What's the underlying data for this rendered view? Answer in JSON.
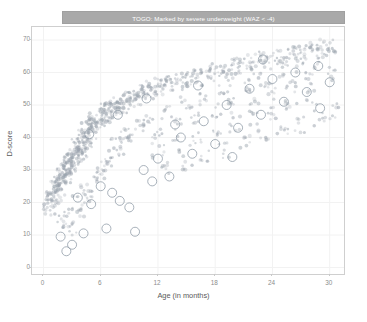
{
  "facet": {
    "strip_label": "TOGO: Marked by severe underweight (WAZ < -4)",
    "strip_bg": "#a9a9a9",
    "strip_text_color": "#ffffff"
  },
  "axis": {
    "x_title": "Age (in months)",
    "y_title": "D-score",
    "x_ticks": [
      "0",
      "6",
      "12",
      "18",
      "24",
      "30"
    ],
    "y_ticks": [
      "0",
      "10",
      "20",
      "30",
      "40",
      "50",
      "60",
      "70"
    ]
  },
  "colors": {
    "point": "#9aa3ad",
    "marked_point": "#8e9aa6",
    "panel_border": "#cfcfcf",
    "grid": "#f2f2f2",
    "tick_text": "#8c8c8c",
    "axis_title": "#5a5a5a",
    "background": "#ffffff"
  },
  "chart_data": {
    "type": "scatter",
    "title": "TOGO: Marked by severe underweight (WAZ < -4)",
    "xlabel": "Age (in months)",
    "ylabel": "D-score",
    "xlim": [
      -1.2,
      31.5
    ],
    "ylim": [
      -2.0,
      74.0
    ],
    "x_ticks": [
      0,
      6,
      12,
      18,
      24,
      30
    ],
    "y_ticks": [
      0,
      10,
      20,
      30,
      40,
      50,
      60,
      70
    ],
    "grid": true,
    "legend": null,
    "series": [
      {
        "name": "All children",
        "role": "background-points",
        "marker": "filled-circle",
        "size": 1.6,
        "color": "#9aa3ad",
        "opacity": 0.55,
        "description": "Dense cloud of D-score vs age observations forming a saturating growth band rising steeply from ~20 at 2 months to ~68 at 30 months, with wide downward scatter.",
        "points": [
          [
            0.6,
            19.5
          ],
          [
            0.7,
            21.0
          ],
          [
            0.8,
            18.0
          ],
          [
            0.9,
            22.5
          ],
          [
            1.0,
            20.0
          ],
          [
            1.1,
            24.0
          ],
          [
            1.2,
            23.0
          ],
          [
            1.3,
            25.5
          ],
          [
            1.4,
            22.0
          ],
          [
            1.5,
            26.0
          ],
          [
            1.6,
            27.0
          ],
          [
            1.7,
            24.5
          ],
          [
            1.8,
            28.0
          ],
          [
            1.9,
            26.5
          ],
          [
            2.0,
            29.0
          ],
          [
            2.1,
            27.5
          ],
          [
            2.2,
            30.0
          ],
          [
            2.3,
            28.5
          ],
          [
            2.4,
            31.0
          ],
          [
            2.5,
            29.5
          ],
          [
            2.6,
            32.0
          ],
          [
            2.7,
            30.5
          ],
          [
            2.8,
            33.0
          ],
          [
            2.9,
            31.5
          ],
          [
            3.0,
            34.0
          ],
          [
            3.1,
            32.5
          ],
          [
            3.2,
            35.0
          ],
          [
            3.3,
            33.5
          ],
          [
            3.4,
            36.0
          ],
          [
            3.5,
            34.5
          ],
          [
            3.6,
            37.0
          ],
          [
            3.7,
            35.5
          ],
          [
            3.8,
            38.0
          ],
          [
            3.9,
            36.5
          ],
          [
            4.0,
            39.0
          ],
          [
            4.1,
            37.5
          ],
          [
            4.2,
            40.0
          ],
          [
            4.3,
            38.5
          ],
          [
            4.4,
            41.0
          ],
          [
            4.5,
            39.5
          ],
          [
            4.6,
            42.0
          ],
          [
            4.7,
            40.5
          ],
          [
            4.8,
            43.0
          ],
          [
            4.9,
            41.5
          ],
          [
            5.0,
            43.5
          ],
          [
            5.2,
            44.0
          ],
          [
            5.4,
            45.0
          ],
          [
            5.6,
            44.5
          ],
          [
            5.8,
            46.0
          ],
          [
            6.0,
            45.5
          ],
          [
            6.2,
            47.0
          ],
          [
            6.4,
            46.5
          ],
          [
            6.6,
            48.0
          ],
          [
            6.8,
            47.5
          ],
          [
            7.0,
            48.5
          ],
          [
            7.2,
            49.0
          ],
          [
            7.4,
            48.0
          ],
          [
            7.6,
            50.0
          ],
          [
            7.8,
            49.5
          ],
          [
            8.0,
            50.5
          ],
          [
            8.3,
            51.0
          ],
          [
            8.6,
            50.0
          ],
          [
            8.9,
            52.0
          ],
          [
            9.2,
            51.5
          ],
          [
            9.5,
            52.5
          ],
          [
            9.8,
            53.0
          ],
          [
            10.1,
            52.0
          ],
          [
            10.4,
            54.0
          ],
          [
            10.7,
            53.5
          ],
          [
            11.0,
            54.5
          ],
          [
            11.4,
            55.0
          ],
          [
            11.8,
            54.0
          ],
          [
            12.2,
            56.0
          ],
          [
            12.6,
            55.5
          ],
          [
            13.0,
            56.5
          ],
          [
            13.5,
            57.0
          ],
          [
            14.0,
            56.0
          ],
          [
            14.5,
            58.0
          ],
          [
            15.0,
            57.5
          ],
          [
            15.5,
            58.5
          ],
          [
            16.0,
            59.0
          ],
          [
            16.5,
            58.0
          ],
          [
            17.0,
            60.0
          ],
          [
            17.5,
            59.5
          ],
          [
            18.0,
            60.5
          ],
          [
            18.6,
            61.0
          ],
          [
            19.2,
            60.0
          ],
          [
            19.8,
            62.0
          ],
          [
            20.4,
            61.5
          ],
          [
            21.0,
            62.5
          ],
          [
            21.6,
            63.0
          ],
          [
            22.2,
            62.0
          ],
          [
            22.8,
            64.0
          ],
          [
            23.4,
            63.5
          ],
          [
            24.0,
            64.5
          ],
          [
            24.6,
            65.0
          ],
          [
            25.2,
            64.0
          ],
          [
            25.8,
            66.0
          ],
          [
            26.4,
            65.5
          ],
          [
            27.0,
            66.5
          ],
          [
            27.6,
            67.0
          ],
          [
            28.2,
            66.0
          ],
          [
            28.8,
            68.0
          ],
          [
            29.4,
            67.5
          ],
          [
            30.0,
            68.5
          ],
          [
            2.0,
            14.0
          ],
          [
            2.5,
            16.0
          ],
          [
            3.0,
            12.0
          ],
          [
            3.5,
            20.0
          ],
          [
            4.0,
            18.0
          ],
          [
            4.5,
            24.0
          ],
          [
            5.0,
            22.0
          ],
          [
            5.5,
            30.0
          ],
          [
            6.0,
            28.0
          ],
          [
            6.5,
            34.0
          ],
          [
            7.0,
            32.0
          ],
          [
            7.5,
            38.0
          ],
          [
            8.0,
            36.0
          ],
          [
            8.5,
            42.0
          ],
          [
            9.0,
            40.0
          ],
          [
            10.0,
            44.0
          ],
          [
            11.0,
            46.0
          ],
          [
            12.0,
            42.0
          ],
          [
            13.0,
            48.0
          ],
          [
            14.0,
            44.0
          ],
          [
            15.0,
            50.0
          ],
          [
            16.0,
            46.0
          ],
          [
            17.0,
            52.0
          ],
          [
            18.0,
            48.0
          ],
          [
            19.0,
            54.0
          ],
          [
            20.0,
            50.0
          ],
          [
            21.0,
            56.0
          ],
          [
            22.0,
            52.0
          ],
          [
            23.0,
            58.0
          ],
          [
            24.0,
            54.0
          ],
          [
            25.0,
            60.0
          ],
          [
            26.0,
            56.0
          ],
          [
            27.0,
            62.0
          ],
          [
            28.0,
            58.0
          ],
          [
            29.0,
            63.0
          ],
          [
            30.0,
            60.0
          ],
          [
            12.0,
            36.0
          ],
          [
            14.0,
            38.0
          ],
          [
            16.0,
            40.0
          ],
          [
            18.0,
            42.0
          ],
          [
            20.0,
            44.0
          ],
          [
            22.0,
            46.0
          ],
          [
            24.0,
            48.0
          ],
          [
            26.0,
            50.0
          ],
          [
            28.0,
            52.0
          ],
          [
            13.0,
            30.0
          ],
          [
            15.0,
            32.0
          ],
          [
            17.0,
            34.0
          ],
          [
            19.0,
            36.0
          ],
          [
            21.0,
            38.0
          ],
          [
            23.0,
            40.0
          ],
          [
            25.0,
            42.0
          ],
          [
            27.0,
            44.0
          ],
          [
            29.0,
            46.0
          ],
          [
            30.5,
            48.0
          ]
        ]
      },
      {
        "name": "Marked: severe underweight (WAZ < -4)",
        "role": "highlighted-points",
        "marker": "open-circle",
        "size": 4.5,
        "color": "#8e9aa6",
        "opacity": 0.85,
        "description": "Larger open circles flagging children with weight-for-age Z-score below -4; scattered mostly below the main growth band.",
        "points": [
          [
            1.8,
            9.5
          ],
          [
            2.4,
            5.0
          ],
          [
            3.0,
            7.0
          ],
          [
            3.6,
            21.5
          ],
          [
            4.2,
            10.5
          ],
          [
            5.0,
            19.5
          ],
          [
            6.0,
            25.0
          ],
          [
            6.6,
            12.0
          ],
          [
            7.2,
            23.0
          ],
          [
            8.0,
            20.5
          ],
          [
            9.0,
            18.5
          ],
          [
            9.6,
            11.0
          ],
          [
            10.5,
            30.0
          ],
          [
            11.4,
            26.5
          ],
          [
            12.0,
            33.5
          ],
          [
            13.2,
            28.0
          ],
          [
            14.4,
            40.0
          ],
          [
            15.6,
            35.0
          ],
          [
            16.8,
            45.0
          ],
          [
            18.0,
            38.0
          ],
          [
            19.2,
            50.0
          ],
          [
            20.4,
            43.0
          ],
          [
            21.6,
            55.0
          ],
          [
            22.8,
            47.0
          ],
          [
            24.0,
            58.0
          ],
          [
            25.2,
            51.0
          ],
          [
            26.4,
            60.0
          ],
          [
            27.6,
            54.0
          ],
          [
            28.8,
            62.0
          ],
          [
            30.0,
            57.0
          ],
          [
            4.8,
            41.0
          ],
          [
            7.8,
            47.0
          ],
          [
            10.8,
            52.0
          ],
          [
            13.8,
            44.0
          ],
          [
            16.2,
            56.0
          ],
          [
            19.8,
            34.0
          ],
          [
            23.0,
            64.0
          ],
          [
            29.0,
            49.0
          ]
        ]
      }
    ]
  }
}
